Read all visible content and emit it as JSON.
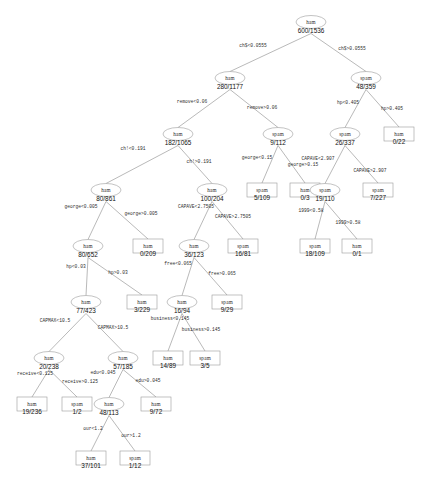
{
  "diagram": {
    "type": "decision-tree",
    "node_shapes": {
      "internal": "ellipse",
      "leaf": "rectangle"
    },
    "colors": {
      "stroke": "#9a9a9a",
      "edge": "#8a8a8a",
      "text": "#111111",
      "background": "#ffffff"
    }
  },
  "nodes": [
    {
      "id": "n0",
      "class_label": "ham",
      "count": "600/1536",
      "kind": "internal",
      "x": 311,
      "y": 22
    },
    {
      "id": "n1",
      "class_label": "ham",
      "count": "280/1177",
      "kind": "internal",
      "x": 230,
      "y": 78
    },
    {
      "id": "n2",
      "class_label": "spam",
      "count": "48/359",
      "kind": "internal",
      "x": 366,
      "y": 78
    },
    {
      "id": "n3",
      "class_label": "ham",
      "count": "182/1065",
      "kind": "internal",
      "x": 178,
      "y": 134
    },
    {
      "id": "n4",
      "class_label": "spam",
      "count": "9/112",
      "kind": "internal",
      "x": 278,
      "y": 134
    },
    {
      "id": "n5",
      "class_label": "spam",
      "count": "26/337",
      "kind": "internal",
      "x": 345,
      "y": 134
    },
    {
      "id": "n6",
      "class_label": "ham",
      "count": "0/22",
      "kind": "leaf",
      "x": 399,
      "y": 134
    },
    {
      "id": "n7",
      "class_label": "ham",
      "count": "80/861",
      "kind": "internal",
      "x": 106,
      "y": 190
    },
    {
      "id": "n8",
      "class_label": "ham",
      "count": "100/204",
      "kind": "internal",
      "x": 212,
      "y": 190
    },
    {
      "id": "n9",
      "class_label": "spam",
      "count": "5/109",
      "kind": "leaf",
      "x": 262,
      "y": 190
    },
    {
      "id": "n10",
      "class_label": "ham",
      "count": "0/3",
      "kind": "leaf",
      "x": 305,
      "y": 190
    },
    {
      "id": "n11",
      "class_label": "spam",
      "count": "19/110",
      "kind": "internal",
      "x": 325,
      "y": 190
    },
    {
      "id": "n12",
      "class_label": "spam",
      "count": "7/227",
      "kind": "leaf",
      "x": 378,
      "y": 190
    },
    {
      "id": "n13",
      "class_label": "ham",
      "count": "80/652",
      "kind": "internal",
      "x": 88,
      "y": 246
    },
    {
      "id": "n14",
      "class_label": "ham",
      "count": "0/209",
      "kind": "leaf",
      "x": 148,
      "y": 246
    },
    {
      "id": "n15",
      "class_label": "ham",
      "count": "36/123",
      "kind": "internal",
      "x": 194,
      "y": 246
    },
    {
      "id": "n16",
      "class_label": "spam",
      "count": "16/81",
      "kind": "leaf",
      "x": 243,
      "y": 246
    },
    {
      "id": "n17",
      "class_label": "spam",
      "count": "18/109",
      "kind": "leaf",
      "x": 315,
      "y": 246
    },
    {
      "id": "n18",
      "class_label": "ham",
      "count": "0/1",
      "kind": "leaf",
      "x": 357,
      "y": 246
    },
    {
      "id": "n19",
      "class_label": "ham",
      "count": "77/423",
      "kind": "internal",
      "x": 86,
      "y": 302
    },
    {
      "id": "n20",
      "class_label": "ham",
      "count": "3/229",
      "kind": "leaf",
      "x": 142,
      "y": 302
    },
    {
      "id": "n21",
      "class_label": "ham",
      "count": "16/94",
      "kind": "internal",
      "x": 182,
      "y": 302
    },
    {
      "id": "n22",
      "class_label": "spam",
      "count": "9/29",
      "kind": "leaf",
      "x": 227,
      "y": 302
    },
    {
      "id": "n23",
      "class_label": "ham",
      "count": "20/238",
      "kind": "internal",
      "x": 49,
      "y": 358
    },
    {
      "id": "n24",
      "class_label": "ham",
      "count": "57/185",
      "kind": "internal",
      "x": 123,
      "y": 358
    },
    {
      "id": "n25",
      "class_label": "ham",
      "count": "14/89",
      "kind": "leaf",
      "x": 168,
      "y": 358
    },
    {
      "id": "n26",
      "class_label": "spam",
      "count": "3/5",
      "kind": "leaf",
      "x": 205,
      "y": 358
    },
    {
      "id": "n27",
      "class_label": "ham",
      "count": "19/236",
      "kind": "leaf",
      "x": 32,
      "y": 404
    },
    {
      "id": "n28",
      "class_label": "spam",
      "count": "1/2",
      "kind": "leaf",
      "x": 77,
      "y": 404
    },
    {
      "id": "n29",
      "class_label": "ham",
      "count": "48/113",
      "kind": "internal",
      "x": 109,
      "y": 404
    },
    {
      "id": "n30",
      "class_label": "ham",
      "count": "9/72",
      "kind": "leaf",
      "x": 156,
      "y": 404
    },
    {
      "id": "n31",
      "class_label": "ham",
      "count": "37/101",
      "kind": "leaf",
      "x": 91,
      "y": 458
    },
    {
      "id": "n32",
      "class_label": "spam",
      "count": "1/12",
      "kind": "leaf",
      "x": 135,
      "y": 458
    }
  ],
  "edges": [
    {
      "from": "n0",
      "to": "n1",
      "label": "ch$<0.0555",
      "lx": 253,
      "ly": 47
    },
    {
      "from": "n0",
      "to": "n2",
      "label": "ch$>0.0555",
      "lx": 352,
      "ly": 50
    },
    {
      "from": "n1",
      "to": "n3",
      "label": "remove<0.06",
      "lx": 192,
      "ly": 103
    },
    {
      "from": "n1",
      "to": "n4",
      "label": "remove>0.06",
      "lx": 262,
      "ly": 109
    },
    {
      "from": "n2",
      "to": "n5",
      "label": "hp<0.405",
      "lx": 348,
      "ly": 104
    },
    {
      "from": "n2",
      "to": "n6",
      "label": "hp>0.405",
      "lx": 392,
      "ly": 110
    },
    {
      "from": "n3",
      "to": "n7",
      "label": "ch!<0.191",
      "lx": 133,
      "ly": 150
    },
    {
      "from": "n3",
      "to": "n8",
      "label": "ch!>0.191",
      "lx": 199,
      "ly": 163
    },
    {
      "from": "n4",
      "to": "n9",
      "label": "george<0.15",
      "lx": 257,
      "ly": 159
    },
    {
      "from": "n4",
      "to": "n10",
      "label": "george>0.15",
      "lx": 303,
      "ly": 166
    },
    {
      "from": "n5",
      "to": "n11",
      "label": "CAPAVE<2.907",
      "lx": 318,
      "ly": 160
    },
    {
      "from": "n5",
      "to": "n12",
      "label": "CAPAVE>2.907",
      "lx": 370,
      "ly": 172
    },
    {
      "from": "n7",
      "to": "n13",
      "label": "george<0.005",
      "lx": 81,
      "ly": 208
    },
    {
      "from": "n7",
      "to": "n14",
      "label": "george>0.005",
      "lx": 141,
      "ly": 215
    },
    {
      "from": "n8",
      "to": "n15",
      "label": "CAPAVE<2.7505",
      "lx": 196,
      "ly": 208
    },
    {
      "from": "n8",
      "to": "n16",
      "label": "CAPAVE>2.7505",
      "lx": 233,
      "ly": 218
    },
    {
      "from": "n11",
      "to": "n17",
      "label": "1999<0.58",
      "lx": 311,
      "ly": 212
    },
    {
      "from": "n11",
      "to": "n18",
      "label": "1999>0.58",
      "lx": 348,
      "ly": 224
    },
    {
      "from": "n13",
      "to": "n19",
      "label": "hp<0.03",
      "lx": 76,
      "ly": 268
    },
    {
      "from": "n13",
      "to": "n20",
      "label": "hp>0.03",
      "lx": 118,
      "ly": 274
    },
    {
      "from": "n15",
      "to": "n21",
      "label": "free<0.065",
      "lx": 178,
      "ly": 265
    },
    {
      "from": "n15",
      "to": "n22",
      "label": "free>0.065",
      "lx": 222,
      "ly": 275
    },
    {
      "from": "n19",
      "to": "n23",
      "label": "CAPMAX<10.5",
      "lx": 55,
      "ly": 322
    },
    {
      "from": "n19",
      "to": "n24",
      "label": "CAPMAX>10.5",
      "lx": 113,
      "ly": 329
    },
    {
      "from": "n21",
      "to": "n25",
      "label": "business<0.145",
      "lx": 170,
      "ly": 320
    },
    {
      "from": "n21",
      "to": "n26",
      "label": "business>0.145",
      "lx": 201,
      "ly": 331
    },
    {
      "from": "n23",
      "to": "n27",
      "label": "receive<0.125",
      "lx": 35,
      "ly": 375
    },
    {
      "from": "n23",
      "to": "n28",
      "label": "receive>0.125",
      "lx": 80,
      "ly": 383
    },
    {
      "from": "n24",
      "to": "n29",
      "label": "edu<0.045",
      "lx": 103,
      "ly": 374
    },
    {
      "from": "n24",
      "to": "n30",
      "label": "edu>0.045",
      "lx": 148,
      "ly": 382
    },
    {
      "from": "n29",
      "to": "n31",
      "label": "our<1.2",
      "lx": 93,
      "ly": 430
    },
    {
      "from": "n29",
      "to": "n32",
      "label": "our>1.2",
      "lx": 131,
      "ly": 437
    }
  ]
}
